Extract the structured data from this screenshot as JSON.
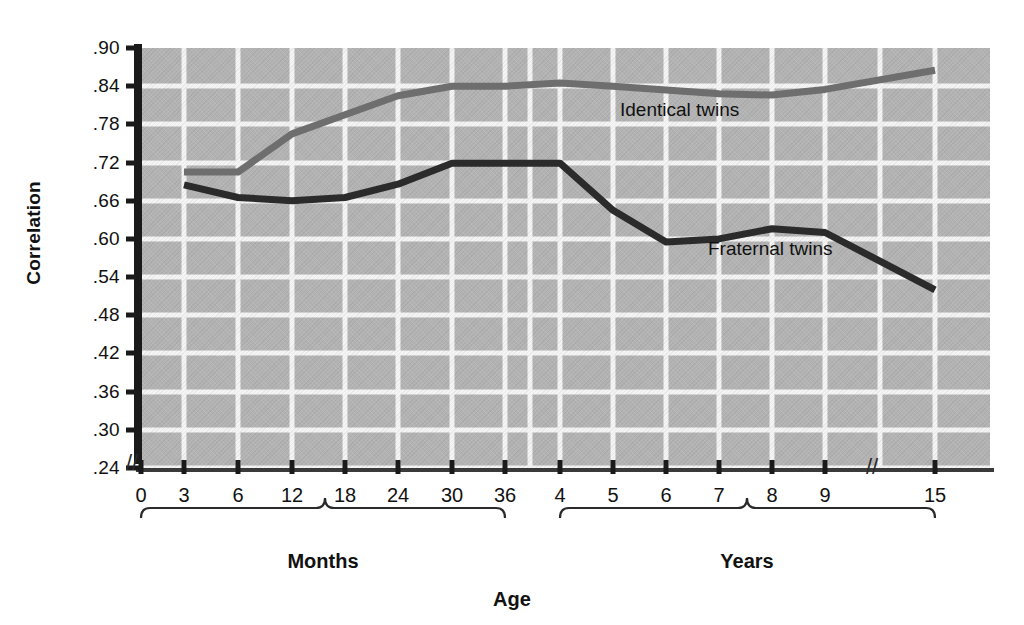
{
  "figure": {
    "caption_remnant": "",
    "background": "#ffffff"
  },
  "axis_titles": {
    "y": "Correlation",
    "x": "Age"
  },
  "groups": [
    {
      "name": "months-group",
      "label": "Months"
    },
    {
      "name": "years-group",
      "label": "Years"
    }
  ],
  "series_labels": {
    "identical": "Identical twins",
    "fraternal": "Fraternal twins"
  },
  "colors": {
    "panel": "#b3b3b3",
    "grid": "#f4f4f4",
    "identical": "#6e6e6e",
    "fraternal": "#2b2b2b",
    "axis": "#1a1a1a",
    "text": "#111111"
  },
  "chart_data": {
    "type": "line",
    "title": "",
    "xlabel": "Age",
    "ylabel": "Correlation",
    "ylim": [
      0.24,
      0.9
    ],
    "grid": true,
    "legend_position": "inline-annotation",
    "x_axis_note": "Two-segment axis: months (0-36) then years (4-15); axis breaks before 0 and between 9 and 15 years",
    "y_axis_break": true,
    "yticks": [
      ".90",
      ".84",
      ".78",
      ".72",
      ".66",
      ".60",
      ".54",
      ".48",
      ".42",
      ".36",
      ".30",
      ".24"
    ],
    "ytick_values": [
      0.9,
      0.84,
      0.78,
      0.72,
      0.66,
      0.6,
      0.54,
      0.48,
      0.42,
      0.36,
      0.3,
      0.24
    ],
    "xticks": [
      "0",
      "3",
      "6",
      "12",
      "18",
      "24",
      "30",
      "36",
      "4",
      "5",
      "6",
      "7",
      "8",
      "9",
      "15"
    ],
    "categories": [
      "3 mo",
      "6 mo",
      "12 mo",
      "18 mo",
      "24 mo",
      "30 mo",
      "36 mo",
      "4 yr",
      "5 yr",
      "6 yr",
      "7 yr",
      "8 yr",
      "9 yr",
      "15 yr"
    ],
    "series": [
      {
        "name": "Identical twins",
        "color": "#6e6e6e",
        "values": [
          0.705,
          0.705,
          0.765,
          0.795,
          0.825,
          0.84,
          0.84,
          0.845,
          0.84,
          0.834,
          0.828,
          0.826,
          0.835,
          0.865
        ]
      },
      {
        "name": "Fraternal twins",
        "color": "#2b2b2b",
        "values": [
          0.685,
          0.665,
          0.66,
          0.665,
          0.686,
          0.719,
          0.719,
          0.719,
          0.645,
          0.595,
          0.6,
          0.616,
          0.61,
          0.52
        ]
      }
    ]
  }
}
